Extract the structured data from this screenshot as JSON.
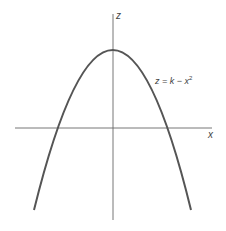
{
  "diagram": {
    "type": "function-graph",
    "equation_label": {
      "lhs": "z = k",
      "op": " − ",
      "var": "x",
      "exp": "2"
    },
    "axes": {
      "horizontal_label": "x",
      "vertical_label": "z"
    },
    "curve": {
      "shape": "downward parabola",
      "vertex": "(0, k)",
      "color": "#555555"
    },
    "axis_color": "#666666"
  }
}
